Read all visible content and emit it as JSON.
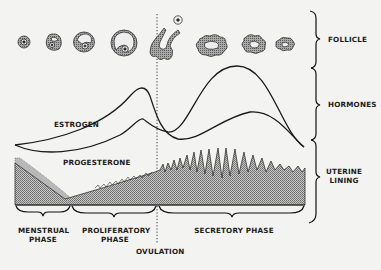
{
  "diagram": {
    "type": "menstrual-cycle",
    "sections": {
      "follicle": "FOLLICLE",
      "hormones": "HORMONES",
      "uterine_lining": "UTERINE\nLINING"
    },
    "hormone_labels": {
      "estrogen": "ESTROGEN",
      "progesterone": "PROGESTERONE"
    },
    "phases": {
      "menstrual": "MENSTRUAL\nPHASE",
      "proliferatory": "PROLIFERATORY\nPHASE",
      "secretory": "SECRETORY PHASE"
    },
    "event": {
      "ovulation": "OVULATION"
    },
    "follicle_stages": [
      "primary-follicle",
      "secondary-follicle",
      "growing-follicle",
      "mature-follicle",
      "ruptured-follicle-with-ovum",
      "corpus-luteum-large",
      "corpus-luteum-medium",
      "corpus-luteum-small"
    ],
    "colors": {
      "ink": "#1a1a1a",
      "fill": "#9a9a9a",
      "background": "#f3f3f1"
    }
  }
}
